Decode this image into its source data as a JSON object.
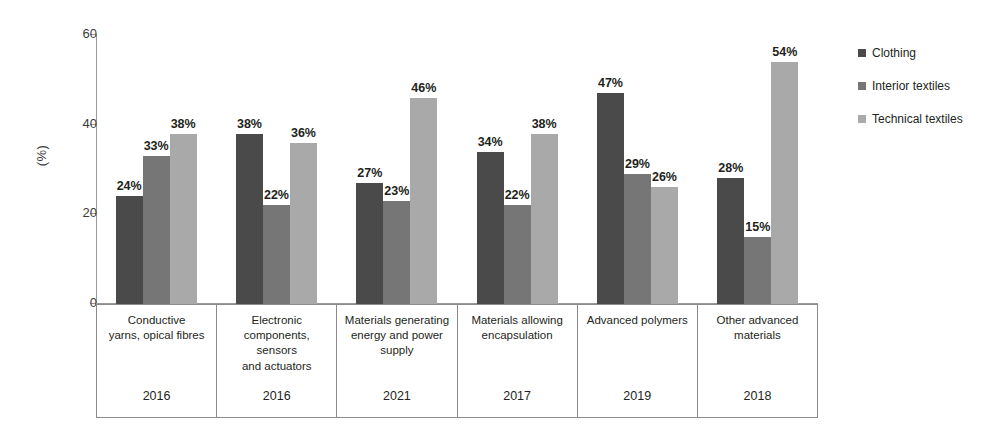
{
  "chart_data": {
    "type": "bar",
    "title": "",
    "xlabel": "",
    "ylabel": "(%)",
    "ylim": [
      0,
      60
    ],
    "yticks": [
      "0",
      "20",
      "40",
      "60"
    ],
    "grid": false,
    "legend_position": "right",
    "categories": [
      "Conductive yarns, opical fibres",
      "Electronic components, sensors and actuators",
      "Materials generating energy and power supply",
      "Materials allowing encapsulation",
      "Advanced polymers",
      "Other advanced materials"
    ],
    "category_lines": [
      [
        "Conductive",
        "yarns, opical fibres"
      ],
      [
        "Electronic",
        "components, sensors",
        "and actuators"
      ],
      [
        "Materials generating",
        "energy and power",
        "supply"
      ],
      [
        "Materials allowing",
        "encapsulation"
      ],
      [
        "Advanced polymers"
      ],
      [
        "Other advanced",
        "materials"
      ]
    ],
    "years": [
      "2016",
      "2016",
      "2021",
      "2017",
      "2019",
      "2018"
    ],
    "series": [
      {
        "name": "Clothing",
        "color": "#4a4a4a",
        "values": [
          24,
          38,
          27,
          34,
          47,
          28
        ],
        "labels": [
          "24%",
          "38%",
          "27%",
          "34%",
          "47%",
          "28%"
        ]
      },
      {
        "name": "Interior textiles",
        "color": "#767676",
        "values": [
          33,
          22,
          23,
          22,
          29,
          15
        ],
        "labels": [
          "33%",
          "22%",
          "23%",
          "22%",
          "29%",
          "15%"
        ]
      },
      {
        "name": "Technical textiles",
        "color": "#a9a9a9",
        "values": [
          38,
          36,
          46,
          38,
          26,
          54
        ],
        "labels": [
          "38%",
          "36%",
          "46%",
          "38%",
          "26%",
          "54%"
        ]
      }
    ]
  }
}
